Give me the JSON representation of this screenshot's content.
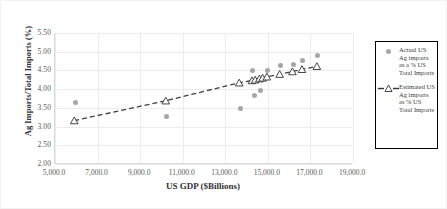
{
  "chart_data": {
    "type": "scatter",
    "title": "",
    "xlabel": "US GDP ($Billions)",
    "ylabel": "Ag Imports/Total Imports (%)",
    "xlim": [
      5000,
      19000
    ],
    "ylim": [
      2.0,
      5.5
    ],
    "xticks": [
      "5,000.0",
      "7,000.0",
      "9,000.0",
      "11,000.0",
      "13,000.0",
      "15,000.0",
      "17,000.0",
      "19,000.0"
    ],
    "xtick_values": [
      5000,
      7000,
      9000,
      11000,
      13000,
      15000,
      17000,
      19000
    ],
    "yticks": [
      "2.00",
      "2.50",
      "3.00",
      "3.50",
      "4.00",
      "4.50",
      "5.00",
      "5.50"
    ],
    "ytick_values": [
      2.0,
      2.5,
      3.0,
      3.5,
      4.0,
      4.5,
      5.0,
      5.5
    ],
    "grid": true,
    "legend_position": "right",
    "marker_color": "#a6a6a6",
    "line_color": "#404040",
    "series": [
      {
        "name": "Actual US Ag imports as a % US Total Imports",
        "type": "scatter",
        "marker": "circle",
        "points": [
          {
            "x": 5950,
            "y": 3.65
          },
          {
            "x": 10250,
            "y": 3.27
          },
          {
            "x": 13700,
            "y": 3.49
          },
          {
            "x": 14300,
            "y": 4.51
          },
          {
            "x": 14350,
            "y": 3.83
          },
          {
            "x": 14650,
            "y": 3.97
          },
          {
            "x": 14700,
            "y": 4.26
          },
          {
            "x": 15000,
            "y": 4.5
          },
          {
            "x": 15600,
            "y": 4.64
          },
          {
            "x": 16200,
            "y": 4.67
          },
          {
            "x": 16650,
            "y": 4.76
          },
          {
            "x": 17350,
            "y": 4.91
          }
        ]
      },
      {
        "name": "Estimated US Ag imports as % US Total Imports",
        "type": "line",
        "marker": "triangle",
        "linestyle": "dashed",
        "points": [
          {
            "x": 5950,
            "y": 3.16
          },
          {
            "x": 10250,
            "y": 3.69
          },
          {
            "x": 13700,
            "y": 4.17
          },
          {
            "x": 14300,
            "y": 4.23
          },
          {
            "x": 14450,
            "y": 4.25
          },
          {
            "x": 14650,
            "y": 4.28
          },
          {
            "x": 14800,
            "y": 4.3
          },
          {
            "x": 15000,
            "y": 4.33
          },
          {
            "x": 15600,
            "y": 4.4
          },
          {
            "x": 16200,
            "y": 4.47
          },
          {
            "x": 16650,
            "y": 4.53
          },
          {
            "x": 17350,
            "y": 4.61
          }
        ]
      }
    ]
  },
  "legend": {
    "entries": [
      {
        "key": "circle-marker",
        "label": "Actual US Ag imports as a % US Total Imports"
      },
      {
        "key": "dashed-line-triangle-marker",
        "label": "Estimated US Ag imports as % US Total Imports"
      }
    ]
  },
  "axes": {
    "x_title": "US GDP ($Billions)",
    "y_title": "Ag Imports/Total Imports (%)"
  }
}
